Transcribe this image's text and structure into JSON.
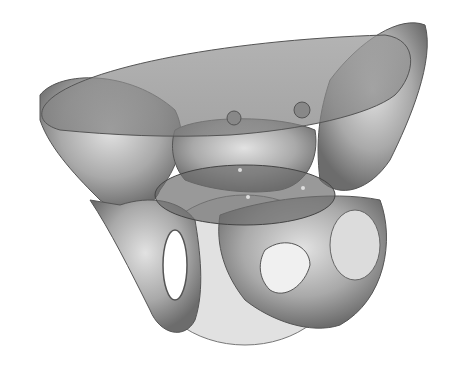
{
  "image": {
    "subject": "3D rendering of human pelvis with translucent pelvic planes",
    "width": 457,
    "height": 374,
    "background": "#ffffff",
    "colors": {
      "bone_light": "#d8d8d8",
      "bone_mid": "#a8a8a8",
      "bone_dark": "#6a6a6a",
      "plane_fill": "#8a8a8a",
      "plane_edge": "#555555"
    }
  }
}
